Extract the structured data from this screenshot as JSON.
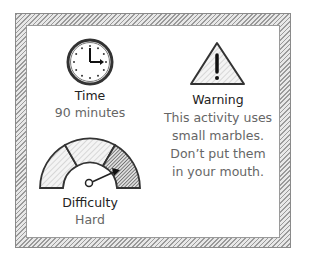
{
  "time": {
    "icon": "clock-icon",
    "title": "Time",
    "value": "90 minutes"
  },
  "warning": {
    "icon": "warning-triangle-icon",
    "title": "Warning",
    "lines": [
      "This activity uses",
      "small marbles.",
      "Don’t put them",
      "in your mouth."
    ]
  },
  "difficulty": {
    "icon": "difficulty-gauge-icon",
    "title": "Difficulty",
    "value": "Hard"
  },
  "colors": {
    "ink": "#222222",
    "muted": "#666666",
    "hatch": "#9a9a9a"
  }
}
